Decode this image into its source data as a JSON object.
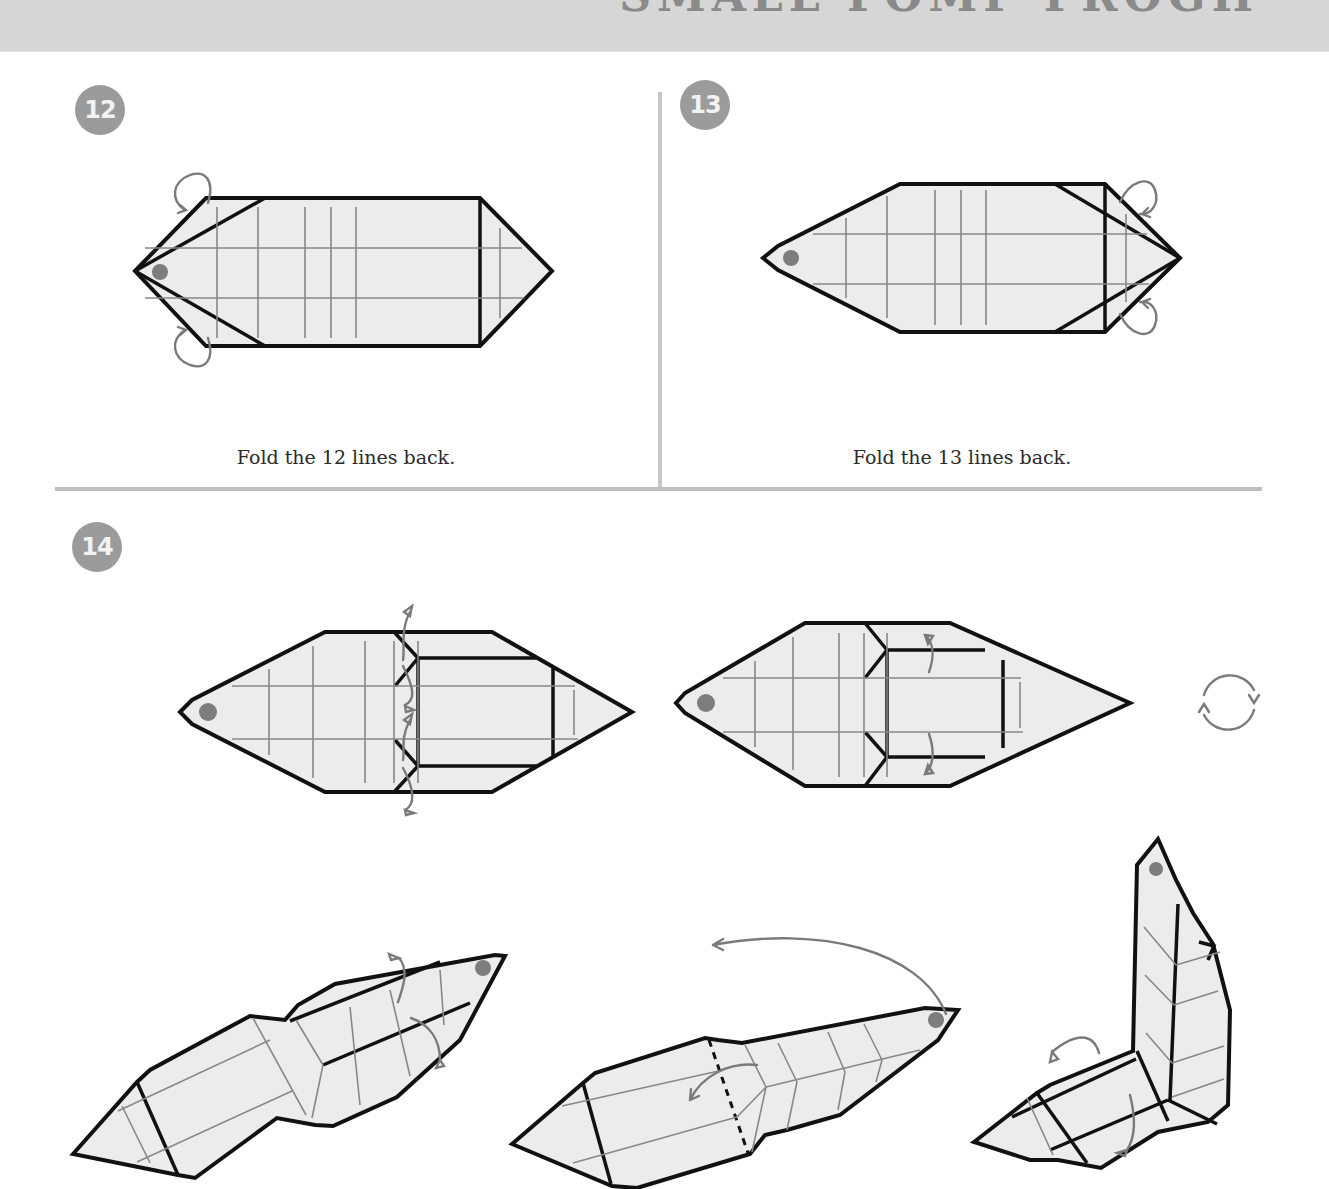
{
  "header": {
    "title": "SMALL FOMP FROGH",
    "band_color": "#d6d6d6"
  },
  "steps": [
    {
      "number": "12",
      "caption": "Fold the 12 lines back.",
      "diagram": "flat-hexagon-left-flaps-fold-back"
    },
    {
      "number": "13",
      "caption": "Fold the 13 lines back.",
      "diagram": "flat-hexagon-right-flaps-fold-back"
    },
    {
      "number": "14",
      "caption": "",
      "diagrams": [
        "pleat-fold-model",
        "pleated-model-fold-back",
        "turn-over",
        "3d-model-fold-sides",
        "3d-model-reverse-fold-head",
        "3d-model-finished-shape"
      ]
    }
  ],
  "icons": {
    "turn_over": "rotate-arrows-icon",
    "fold_back": "fold-back-arrow-icon",
    "reference_dot": "dot-marker-icon"
  },
  "colors": {
    "paper": "#ececec",
    "outline": "#111111",
    "crease": "#888888",
    "arrow": "#7a7a7a",
    "badge": "#9b9b9b",
    "divider": "#bdbdbd"
  }
}
